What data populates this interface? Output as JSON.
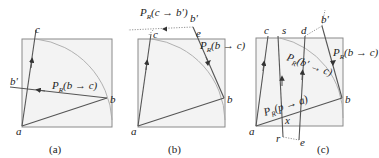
{
  "figure": {
    "panels": [
      {
        "id": "a",
        "caption": "(a)",
        "points": {
          "a": "a",
          "b": "b",
          "c": "c",
          "bprime": "b'"
        },
        "labels": {
          "proj": "P",
          "proj_sub": "R",
          "proj_arg": "(b → c)"
        }
      },
      {
        "id": "b",
        "caption": "(b)",
        "points": {
          "a": "a",
          "b": "b",
          "c": "c",
          "bprime": "b'",
          "e": "e"
        },
        "labels": {
          "proj1": "P",
          "proj1_sub": "R",
          "proj1_arg": "(c → b')",
          "proj2": "P",
          "proj2_sub": "R",
          "proj2_arg": "(b → c)"
        }
      },
      {
        "id": "c",
        "caption": "(c)",
        "points": {
          "a": "a",
          "b": "b",
          "c": "c",
          "s": "s",
          "d": "d",
          "bprime": "b'",
          "r": "r",
          "e": "e",
          "x": "x"
        },
        "labels": {
          "proj1": "P",
          "proj1_sub": "R",
          "proj1_arg": "(b → c)",
          "proj2": "P",
          "proj2_sub": "R",
          "proj2_arg": "(b' → c)",
          "proj3": "P",
          "proj3_sub": "R",
          "proj3_arg": "(p → a)"
        }
      }
    ]
  }
}
